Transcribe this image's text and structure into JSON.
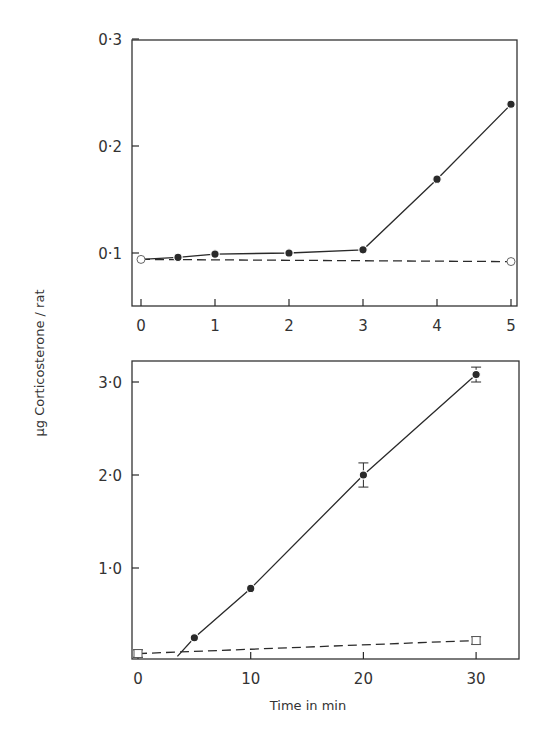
{
  "figure": {
    "shared_ylabel": "µg Corticosterone / rat",
    "colors": {
      "ink": "#2a2a2a",
      "background": "#ffffff"
    }
  },
  "chart_data": [
    {
      "type": "line",
      "title": "",
      "xlabel": "",
      "ylabel": "µg Corticosterone / rat",
      "xlim": [
        -0.1,
        5.05
      ],
      "ylim": [
        0.05,
        0.3
      ],
      "x_ticks": [
        0,
        1,
        2,
        3,
        4,
        5
      ],
      "x_tick_labels": [
        "0",
        "1",
        "2",
        "3",
        "4",
        "5"
      ],
      "y_ticks": [
        0.1,
        0.2,
        0.3
      ],
      "y_tick_labels": [
        "0·1",
        "0·2",
        "0·3"
      ],
      "grid": false,
      "legend": null,
      "series": [
        {
          "name": "treated (filled circles)",
          "marker": "filled-circle",
          "line": "solid",
          "line_start": [
            0,
            0.094
          ],
          "x": [
            0.5,
            1,
            2,
            3,
            4,
            5
          ],
          "y": [
            0.096,
            0.099,
            0.1,
            0.103,
            0.169,
            0.239
          ]
        },
        {
          "name": "control (open circles)",
          "marker": "open-circle",
          "line": "dashed",
          "x": [
            0,
            5
          ],
          "y": [
            0.094,
            0.092
          ]
        }
      ]
    },
    {
      "type": "line",
      "title": "",
      "xlabel": "Time in min",
      "ylabel": "µg Corticosterone / rat",
      "xlim": [
        -0.5,
        34
      ],
      "ylim": [
        0,
        3.2
      ],
      "x_ticks": [
        0,
        10,
        20,
        30
      ],
      "x_tick_labels": [
        "0",
        "10",
        "20",
        "30"
      ],
      "y_ticks": [
        1.0,
        2.0,
        3.0
      ],
      "y_tick_labels": [
        "1·0",
        "2·0",
        "3·0"
      ],
      "grid": false,
      "legend": null,
      "series": [
        {
          "name": "treated (filled circles)",
          "marker": "filled-circle",
          "line": "solid",
          "line_start": [
            3.5,
            0.05
          ],
          "x": [
            5,
            10,
            20,
            30
          ],
          "y": [
            0.25,
            0.78,
            2.0,
            3.08
          ],
          "error": [
            0.03,
            0.03,
            0.13,
            0.08
          ]
        },
        {
          "name": "control (open squares)",
          "marker": "open-square",
          "line": "dashed",
          "x": [
            0,
            30
          ],
          "y": [
            0.08,
            0.22
          ],
          "error": [
            0.04,
            0.04
          ]
        }
      ]
    }
  ]
}
